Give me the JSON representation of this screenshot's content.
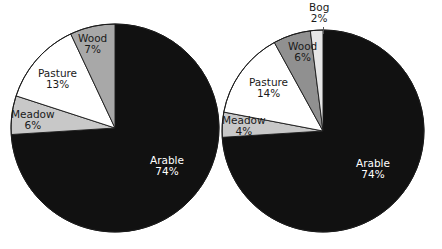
{
  "figure": {
    "background_color": "#ffffff",
    "width": 442,
    "height": 249
  },
  "palette": {
    "arable": "#111111",
    "meadow": "#c8c8c8",
    "pasture": "#ffffff",
    "wood_left": "#a8a8a8",
    "wood_right": "#909090",
    "bog": "#e6e6e6",
    "outline": "#1a1a1a",
    "label_dark": "#1a1a1a",
    "label_light": "#ffffff"
  },
  "charts": [
    {
      "id": "pie-left",
      "name": "left-pie-chart",
      "center": {
        "x": 115,
        "y": 128
      },
      "radius": 104,
      "slices": [
        {
          "key": "arable",
          "label": "Arable",
          "value_label": "74%",
          "value": 74,
          "color": "#111111",
          "label_color": "light",
          "label_x": 150,
          "label_y": 155
        },
        {
          "key": "meadow",
          "label": "Meadow",
          "value_label": "6%",
          "value": 6,
          "color": "#c8c8c8",
          "label_color": "dark",
          "label_x": 11,
          "label_y": 109
        },
        {
          "key": "pasture",
          "label": "Pasture",
          "value_label": "13%",
          "value": 13,
          "color": "#ffffff",
          "label_color": "dark",
          "label_x": 38,
          "label_y": 68
        },
        {
          "key": "wood",
          "label": "Wood",
          "value_label": "7%",
          "value": 7,
          "color": "#a8a8a8",
          "label_color": "dark",
          "label_x": 78,
          "label_y": 33
        }
      ]
    },
    {
      "id": "pie-right",
      "name": "right-pie-chart",
      "center": {
        "x": 323,
        "y": 131
      },
      "radius": 101,
      "slices": [
        {
          "key": "arable",
          "label": "Arable",
          "value_label": "74%",
          "value": 74,
          "color": "#111111",
          "label_color": "light",
          "label_x": 356,
          "label_y": 158
        },
        {
          "key": "meadow",
          "label": "Meadow",
          "value_label": "4%",
          "value": 4,
          "color": "#c8c8c8",
          "label_color": "dark",
          "label_x": 222,
          "label_y": 115
        },
        {
          "key": "pasture",
          "label": "Pasture",
          "value_label": "14%",
          "value": 14,
          "color": "#ffffff",
          "label_color": "dark",
          "label_x": 249,
          "label_y": 77
        },
        {
          "key": "wood",
          "label": "Wood",
          "value_label": "6%",
          "value": 6,
          "color": "#909090",
          "label_color": "dark",
          "label_x": 288,
          "label_y": 41
        },
        {
          "key": "bog",
          "label": "Bog",
          "value_label": "2%",
          "value": 2,
          "color": "#e6e6e6",
          "label_color": "dark",
          "label_x": 309,
          "label_y": 2
        }
      ]
    }
  ],
  "chart_data": {
    "type": "pie",
    "title": "",
    "subtitle": "",
    "xlabel": "",
    "ylabel": "",
    "grid": false,
    "legend_position": "none",
    "units": "percent",
    "label_format": "name + percent",
    "start_angle_deg": 0,
    "direction": "clockwise",
    "panels": [
      {
        "name": "left-pie-chart",
        "position": "left",
        "categories": [
          "Arable",
          "Meadow",
          "Pasture",
          "Wood"
        ],
        "values": [
          74,
          13,
          6,
          7
        ],
        "slice_order_clockwise_from_12": [
          "Arable",
          "Meadow",
          "Pasture",
          "Wood"
        ],
        "slice_order_values": [
          74,
          6,
          13,
          7
        ],
        "colors": [
          "#111111",
          "#c8c8c8",
          "#ffffff",
          "#a8a8a8"
        ],
        "labels": [
          "Arable 74%",
          "Meadow 6%",
          "Pasture 13%",
          "Wood 7%"
        ],
        "total": 100
      },
      {
        "name": "right-pie-chart",
        "position": "right",
        "categories": [
          "Arable",
          "Meadow",
          "Pasture",
          "Wood",
          "Bog"
        ],
        "values": [
          74,
          4,
          14,
          6,
          2
        ],
        "slice_order_clockwise_from_12": [
          "Arable",
          "Meadow",
          "Pasture",
          "Wood",
          "Bog"
        ],
        "slice_order_values": [
          74,
          4,
          14,
          6,
          2
        ],
        "colors": [
          "#111111",
          "#c8c8c8",
          "#ffffff",
          "#909090",
          "#e6e6e6"
        ],
        "labels": [
          "Arable 74%",
          "Meadow 4%",
          "Pasture 14%",
          "Wood 6%",
          "Bog 2%"
        ],
        "total": 100
      }
    ]
  }
}
